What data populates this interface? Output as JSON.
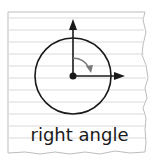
{
  "diagram": {
    "label": "right angle",
    "colors": {
      "paper": "#ffffff",
      "lines": "#d9d9d9",
      "edge": "#bdbdbd",
      "ink": "#1a1a1a",
      "arc": "#7a7a7a"
    }
  }
}
